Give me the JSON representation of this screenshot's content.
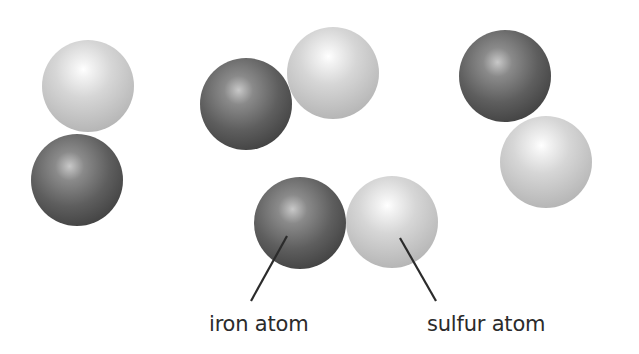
{
  "diagram": {
    "type": "atoms-illustration",
    "colors": {
      "iron": "#555555",
      "sulfur": "#cccccc",
      "leader_line": "#2b2b2b",
      "label_text": "#2b2b2b"
    },
    "groups": [
      {
        "id": "pair-left",
        "atoms": [
          {
            "kind": "sulfur",
            "cx": 88,
            "cy": 86,
            "r": 46
          },
          {
            "kind": "iron",
            "cx": 77,
            "cy": 180,
            "r": 46
          }
        ]
      },
      {
        "id": "pair-top-middle",
        "atoms": [
          {
            "kind": "iron",
            "cx": 246,
            "cy": 104,
            "r": 46
          },
          {
            "kind": "sulfur",
            "cx": 333,
            "cy": 73,
            "r": 46
          }
        ]
      },
      {
        "id": "pair-right",
        "atoms": [
          {
            "kind": "iron",
            "cx": 505,
            "cy": 76,
            "r": 46
          },
          {
            "kind": "sulfur",
            "cx": 546,
            "cy": 162,
            "r": 46
          }
        ]
      },
      {
        "id": "pair-bottom-labeled",
        "atoms": [
          {
            "kind": "iron",
            "cx": 300,
            "cy": 223,
            "r": 46
          },
          {
            "kind": "sulfur",
            "cx": 392,
            "cy": 222,
            "r": 46
          }
        ]
      }
    ],
    "labels": {
      "iron": "iron atom",
      "sulfur": "sulfur atom"
    }
  }
}
